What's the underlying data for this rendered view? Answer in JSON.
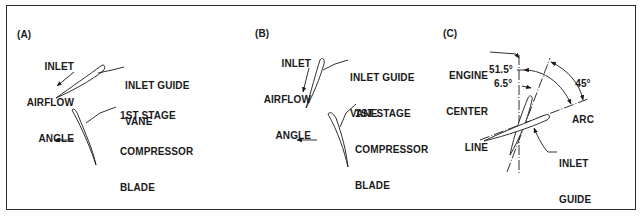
{
  "figure": {
    "panels": [
      {
        "id": "A",
        "tag": "(A)",
        "labels": {
          "inlet_airflow_angle": [
            "INLET",
            "AIRFLOW",
            "ANGLE"
          ],
          "inlet_guide_vane": [
            "INLET GUIDE",
            "VANE"
          ],
          "compressor_blade": [
            "1ST STAGE",
            "COMPRESSOR",
            "BLADE"
          ]
        }
      },
      {
        "id": "B",
        "tag": "(B)",
        "labels": {
          "inlet_airflow_angle": [
            "INLET",
            "AIRFLOW",
            "ANGLE"
          ],
          "inlet_guide_vane": [
            "INLET GUIDE",
            "VANE"
          ],
          "compressor_blade": [
            "1ST STAGE",
            "COMPRESSOR",
            "BLADE"
          ]
        }
      },
      {
        "id": "C",
        "tag": "(C)",
        "labels": {
          "engine_center_line": [
            "ENGINE",
            "CENTER",
            "LINE"
          ],
          "angle_large": "51.5°",
          "angle_small": "6.5°",
          "arc": [
            "45°",
            "ARC"
          ],
          "inlet_guide_vane": [
            "INLET",
            "GUIDE",
            "VANE"
          ]
        }
      }
    ],
    "colors": {
      "ink": "#1a1a1a",
      "border": "#2a2a2a",
      "background": "#ffffff"
    }
  }
}
